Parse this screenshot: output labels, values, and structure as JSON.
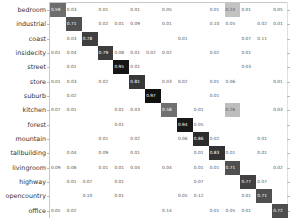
{
  "chart_data": {
    "type": "heatmap",
    "title": "",
    "xlabel": "",
    "ylabel": "",
    "colormap": "grayscale (white=0, black=1)",
    "categories": [
      "bedroom",
      "industrial",
      "coast",
      "insidecity",
      "street",
      "store",
      "suburb",
      "kitchen",
      "forest",
      "mountain",
      "tallbuilding",
      "livingroom",
      "highway",
      "opencountry",
      "office"
    ],
    "matrix": [
      [
        0.59,
        0.03,
        null,
        0.01,
        null,
        0.01,
        null,
        0.05,
        null,
        null,
        0.01,
        0.24,
        0.01,
        null,
        0.05
      ],
      [
        null,
        0.71,
        null,
        0.02,
        0.01,
        0.09,
        null,
        0.01,
        null,
        null,
        0.1,
        0.05,
        null,
        0.02,
        0.01
      ],
      [
        null,
        0.03,
        0.78,
        null,
        null,
        null,
        null,
        null,
        0.01,
        null,
        null,
        null,
        0.07,
        0.11,
        null
      ],
      [
        0.01,
        0.04,
        null,
        0.79,
        0.08,
        0.01,
        0.02,
        0.02,
        null,
        null,
        0.02,
        null,
        0.01,
        null,
        null
      ],
      [
        null,
        0.01,
        null,
        null,
        0.95,
        0.01,
        null,
        null,
        null,
        null,
        null,
        null,
        0.03,
        null,
        null
      ],
      [
        0.01,
        0.03,
        null,
        0.02,
        null,
        0.81,
        null,
        0.03,
        0.02,
        null,
        0.01,
        0.06,
        null,
        null,
        0.01
      ],
      [
        null,
        0.02,
        null,
        null,
        null,
        null,
        0.97,
        null,
        null,
        null,
        0.01,
        null,
        null,
        null,
        null
      ],
      [
        0.07,
        0.01,
        null,
        null,
        0.01,
        0.03,
        null,
        0.58,
        null,
        0.01,
        null,
        0.26,
        null,
        null,
        0.03
      ],
      [
        null,
        null,
        null,
        null,
        0.01,
        null,
        null,
        null,
        0.94,
        0.05,
        null,
        null,
        null,
        null,
        null
      ],
      [
        null,
        null,
        null,
        0.01,
        null,
        0.02,
        null,
        null,
        0.06,
        0.86,
        0.02,
        null,
        null,
        0.01,
        null
      ],
      [
        null,
        0.04,
        null,
        0.09,
        null,
        0.01,
        null,
        null,
        null,
        0.01,
        0.83,
        0.01,
        null,
        0.01,
        null
      ],
      [
        0.09,
        0.06,
        null,
        0.01,
        0.01,
        0.04,
        null,
        0.04,
        null,
        0.01,
        0.01,
        0.71,
        null,
        null,
        0.02
      ],
      [
        null,
        0.01,
        0.07,
        null,
        0.01,
        null,
        null,
        null,
        null,
        0.07,
        null,
        null,
        0.77,
        0.07,
        null
      ],
      [
        null,
        null,
        0.1,
        null,
        0.01,
        null,
        null,
        null,
        0.05,
        0.12,
        null,
        null,
        0.01,
        0.71,
        null
      ],
      [
        0.05,
        0.02,
        null,
        null,
        null,
        null,
        null,
        0.14,
        null,
        null,
        0.01,
        0.05,
        0.01,
        null,
        0.72
      ]
    ],
    "grid": false,
    "legend": "none"
  }
}
